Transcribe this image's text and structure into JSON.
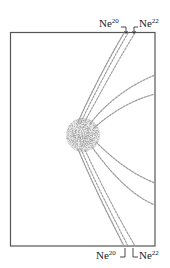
{
  "figure": {
    "frame": {
      "x": 10,
      "y": 32,
      "width": 145,
      "height": 214,
      "stroke": "#555555"
    },
    "center_spot": {
      "cx": 83,
      "cy": 135,
      "r": 17,
      "color": "#555555"
    },
    "trace_color": "#9a9a9a",
    "labels": {
      "top_left": {
        "element": "Ne",
        "mass": "20"
      },
      "top_right": {
        "element": "Ne",
        "mass": "22"
      },
      "bottom_left": {
        "element": "Ne",
        "mass": "20"
      },
      "bottom_right": {
        "element": "Ne",
        "mass": "22"
      }
    }
  }
}
